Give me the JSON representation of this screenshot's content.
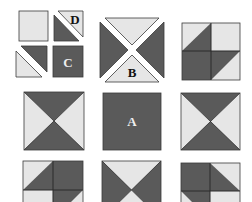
{
  "colors": {
    "dark": "#5a5a5a",
    "light": "#e6e6e6",
    "outline": "#3a3a3a",
    "background": "#ffffff"
  },
  "pieces": {
    "a": {
      "label": "A",
      "desc": "solid dark square"
    },
    "b": {
      "label": "B",
      "desc": "hourglass block: top & bottom light triangles, left & right dark triangles, separated"
    },
    "c": {
      "label": "C",
      "desc": "small solid dark square"
    },
    "d": {
      "label": "D",
      "desc": "half-square triangle: light upper-right, dark lower-left, separated"
    }
  },
  "blocks": [
    {
      "id": "pieces-cut",
      "row": 0,
      "col": 0,
      "desc": "cut pieces: light square, D half-square triangle, half-square triangle, C dark square"
    },
    {
      "id": "block-b",
      "row": 0,
      "col": 1,
      "desc": "piece B hourglass unit"
    },
    {
      "id": "four-patch-top-right",
      "row": 0,
      "col": 2,
      "desc": "four-patch with half-square triangles"
    },
    {
      "id": "hourglass-mid-left",
      "row": 1,
      "col": 0,
      "desc": "hourglass: dark top/bottom, light left/right"
    },
    {
      "id": "block-a",
      "row": 1,
      "col": 1,
      "desc": "solid dark center square A"
    },
    {
      "id": "hourglass-mid-right",
      "row": 1,
      "col": 2,
      "desc": "hourglass: dark top/bottom, light left/right"
    },
    {
      "id": "four-patch-bottom-left",
      "row": 2,
      "col": 0,
      "desc": "four-patch with half-square triangles (cropped)"
    },
    {
      "id": "hourglass-bottom-center",
      "row": 2,
      "col": 1,
      "desc": "hourglass: light top/bottom, dark left/right (cropped)"
    },
    {
      "id": "four-patch-bottom-right",
      "row": 2,
      "col": 2,
      "desc": "four-patch with half-square triangles (cropped)"
    }
  ]
}
